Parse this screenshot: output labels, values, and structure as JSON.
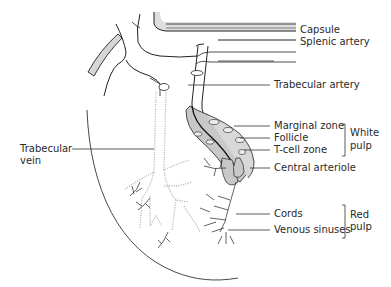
{
  "diagram": {
    "labels": {
      "capsule": "Capsule",
      "splenic_artery": "Splenic artery",
      "trabecular_artery": "Trabecular artery",
      "marginal_zone": "Marginal zone",
      "follicle": "Follicle",
      "t_cell_zone": "T-cell zone",
      "central_arteriole": "Central arteriole",
      "trabecular_vein_line1": "Trabecular",
      "trabecular_vein_line2": "vein",
      "cords": "Cords",
      "venous_sinuses": "Venous sinuses"
    },
    "groups": {
      "white_pulp_line1": "White",
      "white_pulp_line2": "pulp",
      "red_pulp_line1": "Red",
      "red_pulp_line2": "pulp"
    },
    "colors": {
      "line": "#222222",
      "shade": "#c8c8c8",
      "light_shade": "#dedede",
      "vein_dotted": "#bdbdbd",
      "text": "#2a2a2a"
    }
  }
}
